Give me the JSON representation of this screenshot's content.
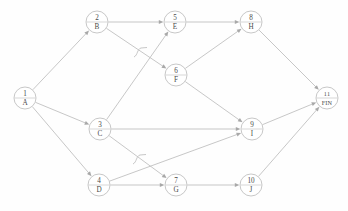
{
  "diagram": {
    "node_radius": 11,
    "colors": {
      "node_stroke": "#b9b9b9",
      "node_fill": "#ffffff",
      "edge": "#bdbdbd",
      "text": "#4a4a4a",
      "background": "#fefefe"
    },
    "nodes": [
      {
        "id": "n1",
        "number": "1",
        "letter": "A",
        "x": 25,
        "y": 98,
        "small": false
      },
      {
        "id": "n2",
        "number": "2",
        "letter": "B",
        "x": 97,
        "y": 22,
        "small": false
      },
      {
        "id": "n3",
        "number": "3",
        "letter": "C",
        "x": 100,
        "y": 129,
        "small": false
      },
      {
        "id": "n4",
        "number": "4",
        "letter": "D",
        "x": 99,
        "y": 185,
        "small": false
      },
      {
        "id": "n5",
        "number": "5",
        "letter": "E",
        "x": 175,
        "y": 22,
        "small": false
      },
      {
        "id": "n6",
        "number": "6",
        "letter": "F",
        "x": 176,
        "y": 75,
        "small": false
      },
      {
        "id": "n7",
        "number": "7",
        "letter": "G",
        "x": 176,
        "y": 185,
        "small": false
      },
      {
        "id": "n8",
        "number": "8",
        "letter": "H",
        "x": 251,
        "y": 22,
        "small": false
      },
      {
        "id": "n9",
        "number": "9",
        "letter": "I",
        "x": 252,
        "y": 129,
        "small": false
      },
      {
        "id": "n10",
        "number": "10",
        "letter": "J",
        "x": 251,
        "y": 185,
        "small": false
      },
      {
        "id": "n11",
        "number": "11",
        "letter": "FIN",
        "x": 327,
        "y": 98,
        "small": true
      }
    ],
    "edges": [
      {
        "from": "n1",
        "to": "n2",
        "label": "A-B"
      },
      {
        "from": "n1",
        "to": "n3",
        "label": "A-C"
      },
      {
        "from": "n1",
        "to": "n4",
        "label": "A-D"
      },
      {
        "from": "n2",
        "to": "n5",
        "label": "B-E"
      },
      {
        "from": "n2",
        "to": "n6",
        "label": "B-F"
      },
      {
        "from": "n3",
        "to": "n5",
        "label": "C-E"
      },
      {
        "from": "n3",
        "to": "n9",
        "label": "C-I"
      },
      {
        "from": "n3",
        "to": "n7",
        "label": "C-G"
      },
      {
        "from": "n4",
        "to": "n7",
        "label": "D-G"
      },
      {
        "from": "n4",
        "to": "n9",
        "label": "D-I"
      },
      {
        "from": "n5",
        "to": "n8",
        "label": "E-H"
      },
      {
        "from": "n6",
        "to": "n8",
        "label": "F-H"
      },
      {
        "from": "n6",
        "to": "n9",
        "label": "F-I"
      },
      {
        "from": "n7",
        "to": "n10",
        "label": "G-J"
      },
      {
        "from": "n8",
        "to": "n11",
        "label": "H-FIN"
      },
      {
        "from": "n9",
        "to": "n11",
        "label": "I-FIN"
      },
      {
        "from": "n10",
        "to": "n11",
        "label": "J-FIN"
      }
    ],
    "crossing_hops": [
      {
        "x": 140,
        "y": 52,
        "label": "hop-upper"
      },
      {
        "x": 139,
        "y": 159,
        "label": "hop-lower"
      }
    ],
    "caption": ""
  }
}
